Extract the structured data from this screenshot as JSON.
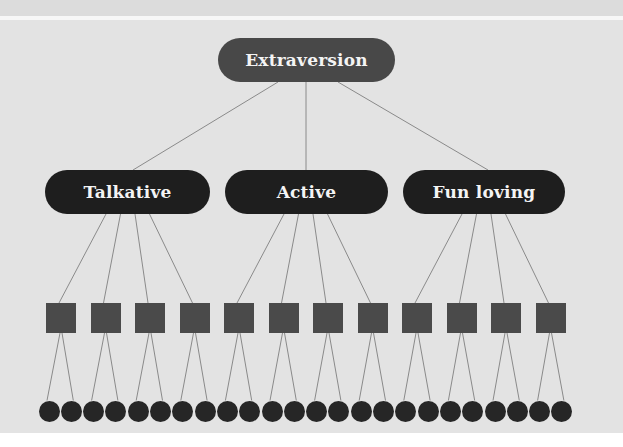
{
  "diagram": {
    "root": {
      "label": "Extraversion",
      "color": "#484848"
    },
    "facets": [
      {
        "label": "Talkative",
        "children": 4
      },
      {
        "label": "Active",
        "children": 4
      },
      {
        "label": "Fun loving",
        "children": 4
      }
    ],
    "facet_color": "#1e1e1e",
    "items": {
      "count": 12,
      "shape": "square",
      "color": "#4a4a4a",
      "children_each": 2
    },
    "responses": {
      "count": 24,
      "shape": "circle",
      "color": "#262626"
    },
    "background_color": "#e3e3e3",
    "edge_color": "#8a8a8a"
  }
}
